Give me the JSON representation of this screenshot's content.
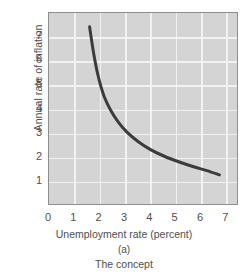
{
  "chart_data": {
    "type": "line",
    "title": "",
    "xlabel": "Unemployment rate (percent)",
    "ylabel": "Annual rate of inflation (percent)",
    "ylabel_lines": [
      "Annual rate of inflation",
      "(percent)"
    ],
    "xlim": [
      0,
      7.5
    ],
    "ylim": [
      0,
      8.0
    ],
    "xticks": [
      0,
      1,
      2,
      3,
      4,
      5,
      6,
      7
    ],
    "xtick_labels": [
      "0",
      "1",
      "2",
      "3",
      "4",
      "5",
      "6",
      "7"
    ],
    "yticks": [
      1,
      2,
      3,
      4,
      5,
      6,
      7
    ],
    "ytick_labels": [
      "1",
      "2",
      "3",
      "4",
      "5",
      "6",
      "7"
    ],
    "grid": true,
    "grid_color": "#f2f2f2",
    "plot_background": "#d4d4d4",
    "curve_color": "#3b3b3b",
    "legend": "none",
    "series": [
      {
        "name": "Phillips curve",
        "x": [
          1.62,
          1.7,
          1.8,
          1.92,
          2.05,
          2.22,
          2.45,
          2.75,
          3.1,
          3.55,
          4.05,
          4.6,
          5.2,
          5.8,
          6.3,
          6.8
        ],
        "y": [
          7.42,
          6.85,
          6.2,
          5.55,
          5.0,
          4.45,
          3.95,
          3.45,
          3.02,
          2.62,
          2.28,
          2.0,
          1.76,
          1.55,
          1.4,
          1.22
        ]
      }
    ],
    "annotations": []
  },
  "caption": {
    "panel_id": "(a)",
    "panel_text": "The concept"
  }
}
